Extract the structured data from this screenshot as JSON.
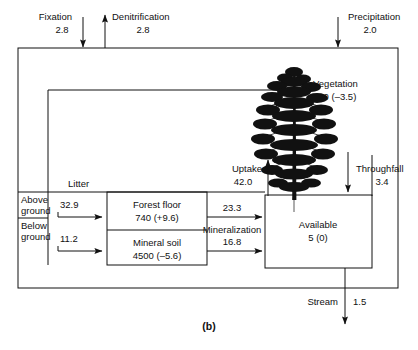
{
  "figure": {
    "caption": "(b)"
  },
  "external_flows": [
    {
      "name": "fixation",
      "label": "Fixation",
      "value": "2.8",
      "direction": "in"
    },
    {
      "name": "denitrification",
      "label": "Denitrification",
      "value": "2.8",
      "direction": "out"
    },
    {
      "name": "precipitation",
      "label": "Precipitation",
      "value": "2.0",
      "direction": "in"
    },
    {
      "name": "stream",
      "label": "Stream",
      "value": "1.5",
      "direction": "out"
    }
  ],
  "compartments": [
    {
      "name": "vegetation",
      "label": "Vegetation",
      "value": "560 (–3.5)"
    },
    {
      "name": "forest-floor",
      "label": "Forest floor",
      "value": "740 (+9.6)"
    },
    {
      "name": "mineral-soil",
      "label": "Mineral soil",
      "value": "4500 (–5.6)"
    },
    {
      "name": "available",
      "label": "Available",
      "value": "5 (0)"
    }
  ],
  "internal_flows": [
    {
      "name": "litter",
      "label": "Litter",
      "value": ""
    },
    {
      "name": "litter-above-ground",
      "label": "Above\nground",
      "label_line1": "Above",
      "label_line2": "ground",
      "value": "32.9"
    },
    {
      "name": "litter-below-ground",
      "label": "Below\nground",
      "label_line1": "Below",
      "label_line2": "ground",
      "value": "11.2"
    },
    {
      "name": "mineralization-forest-floor",
      "label": "",
      "value": "23.3"
    },
    {
      "name": "mineralization-mineral-soil",
      "label": "Mineralization",
      "value": "16.8"
    },
    {
      "name": "uptake",
      "label": "Uptake",
      "value": "42.0"
    },
    {
      "name": "throughfall",
      "label": "Throughfall",
      "value": "3.4"
    }
  ],
  "colors": {
    "line": "#111111",
    "background": "#ffffff"
  }
}
